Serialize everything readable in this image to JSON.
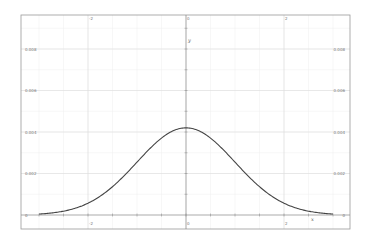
{
  "chart_data": {
    "type": "line",
    "title": "",
    "xlabel": "x",
    "ylabel": "y",
    "xlim": [
      -3.4,
      3.35
    ],
    "ylim": [
      0,
      0.0096
    ],
    "grid": true,
    "legend": null,
    "x_ticks": [
      -2,
      0,
      2
    ],
    "x_tick_labels": [
      "-2",
      "0",
      "2"
    ],
    "y_ticks": [
      0,
      0.002,
      0.004,
      0.006,
      0.008
    ],
    "y_tick_labels": [
      "0",
      "0.002",
      "0.004",
      "0.006",
      "0.008"
    ],
    "series": [
      {
        "name": "normal density",
        "color": "#444444",
        "x": [
          -3.0,
          -2.5,
          -2.0,
          -1.5,
          -1.0,
          -0.5,
          0.0,
          0.5,
          1.0,
          1.5,
          2.0,
          2.5,
          3.0
        ],
        "values": [
          0.0,
          0.0001,
          0.0002,
          0.0005,
          0.0016,
          0.0033,
          0.0042,
          0.0033,
          0.0016,
          0.0005,
          0.0002,
          0.0001,
          0.0
        ]
      }
    ],
    "peak": {
      "x": 0,
      "y": 0.0042
    }
  },
  "axes": {
    "x_name": "x",
    "y_name": "y"
  },
  "colors": {
    "curve": "#444444",
    "frame": "#999999",
    "axis": "#888888",
    "grid": "#eeeeee",
    "labels": "#777777"
  }
}
